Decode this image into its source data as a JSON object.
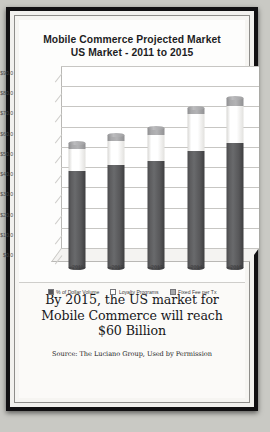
{
  "poster": {
    "caption_lines": [
      "By 2015, the US market for",
      "Mobile Commerce will reach",
      "$60 Billion"
    ],
    "source": "Source: The Luciano Group, Used by Permission"
  },
  "chart_data": {
    "type": "bar",
    "stacked": true,
    "title": "Mobile Commerce Projected Market",
    "subtitle": "US Market  - 2011 to 2015",
    "title_line1": "Mobile Commerce Projected Market",
    "title_line2": "US Market  - 2011 to 2015",
    "xlabel": "",
    "ylabel": "",
    "ylim": [
      0,
      90
    ],
    "ytick_step": 10,
    "grid": true,
    "legend_position": "bottom",
    "categories": [
      "2011",
      "2012",
      "2013",
      "2014",
      "2015"
    ],
    "ytick_labels": [
      "$90.0",
      "$80.0",
      "$70.0",
      "$60.0",
      "$50.0",
      "$40.0",
      "$30.0",
      "$20.0",
      "$10.0",
      "$0.0"
    ],
    "series": [
      {
        "name": "% of Dollar Volume",
        "color": "#55555700",
        "values": [
          48,
          51,
          53,
          58,
          62
        ]
      },
      {
        "name": "Loyalty Programs",
        "color": "#ffffff",
        "values": [
          11,
          12,
          13,
          18,
          18
        ]
      },
      {
        "name": "Fixed Fee per Tx",
        "color": "#a9a9ab",
        "values": [
          3,
          3,
          3,
          3,
          4
        ]
      }
    ],
    "totals": [
      62,
      66,
      69,
      79,
      84
    ]
  }
}
